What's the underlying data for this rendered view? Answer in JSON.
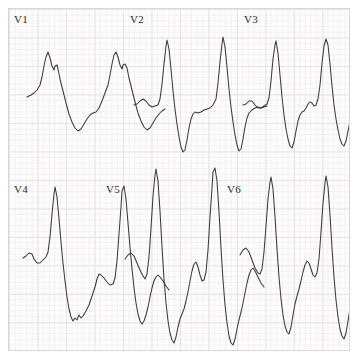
{
  "paper": {
    "background_color": "#fdfdfd",
    "fine_grid_color": "#f4f0f2",
    "major_grid_color": "#e9e3e6",
    "border_color": "#d8d8d8",
    "trace_color": "#3a3a3a",
    "fine_grid_mm_px": 5.7,
    "major_grid_mm_px": 28.5
  },
  "layout": {
    "rows": 2,
    "columns": 3,
    "panel_order": [
      "V1",
      "V2",
      "V3",
      "V4",
      "V5",
      "V6"
    ]
  },
  "leads": [
    {
      "id": "V1",
      "label": "V1",
      "row": 0,
      "column": 0,
      "label_x": 12,
      "label_y": 12,
      "description": "rSR' notched R wave with deep broad S wave, two beats",
      "path": "M 18 88 L 22 86 L 25 84 L 28 81 L 31 76 L 33 68 L 35 57 L 37 48 L 39 43 L 41 49 L 43 57 L 45 61 L 46 57 L 48 56 L 49 60 L 51 70 L 54 82 L 57 94 L 60 105 L 63 113 L 66 119 L 69 122 L 72 120 L 75 115 L 78 110 L 81 106 L 84 104 L 87 103 L 90 99 L 93 92 L 96 84 L 99 76 L 101 66 L 103 55 L 105 46 L 107 43 L 109 48 L 111 56 L 113 60 L 114 56 L 116 55 L 118 59 L 120 69 L 123 81 L 126 93 L 129 104 L 132 112 L 135 118 L 138 121 L 141 119 L 144 114 L 147 109 L 150 105 L 153 102 L 156 100"
    },
    {
      "id": "V2",
      "label": "V2",
      "row": 0,
      "column": 1,
      "label_x": 122,
      "label_y": 12,
      "description": "tall sharp R waves with very deep S waves, two beats",
      "path": "M 10 96 L 13 95 L 16 92 L 19 90 L 22 92 L 25 96 L 28 98 L 31 97 L 34 96 L 36 90 L 38 75 L 40 55 L 42 37 L 43 31 L 45 40 L 47 60 L 49 82 L 51 100 L 53 115 L 55 128 L 57 138 L 59 143 L 61 141 L 63 131 L 65 119 L 67 110 L 69 105 L 71 103 L 74 104 L 77 103 L 80 101 L 83 100 L 86 99 L 89 96 L 92 90 L 94 74 L 96 53 L 98 35 L 99 28 L 101 38 L 103 58 L 105 80 L 107 98 L 109 113 L 111 126 L 113 136 L 115 142 L 117 140 L 119 130 L 121 118 L 123 109 L 125 104 L 128 101 L 131 99 L 134 98 L 137 99 L 140 98 L 143 97"
    },
    {
      "id": "V3",
      "label": "V3",
      "row": 0,
      "column": 2,
      "label_x": 235,
      "label_y": 12,
      "description": "tall R waves with deep S waves and small notch on downstroke, two beats",
      "path": "M 6 96 L 9 95 L 12 92 L 15 92 L 18 96 L 21 99 L 24 99 L 27 97 L 30 95 L 32 89 L 34 72 L 36 50 L 38 36 L 39 32 L 41 44 L 43 66 L 45 88 L 47 106 L 49 120 L 51 130 L 53 137 L 55 139 L 57 133 L 59 122 L 61 112 L 63 106 L 65 103 L 67 102 L 69 99 L 71 95 L 73 93 L 75 94 L 77 97 L 79 96 L 81 90 L 83 76 L 85 54 L 87 37 L 89 30 L 91 36 L 93 55 L 95 77 L 97 96 L 99 110 L 101 121 L 103 130 L 105 135 L 107 137 L 109 132 L 111 122 L 113 113 L 115 108 L 117 106 L 119 105 L 121 102 L 123 97 L 125 94 L 128 93 L 131 95 L 134 98 L 137 99"
    },
    {
      "id": "V4",
      "label": "V4",
      "row": 1,
      "column": 0,
      "label_x": 12,
      "label_y": 185,
      "description": "tall R wave, deep notched S wave with rounded trough, two beats",
      "path": "M 14 249 L 17 247 L 20 244 L 23 245 L 25 250 L 28 254 L 31 254 L 34 251 L 37 248 L 39 243 L 41 228 L 43 205 L 45 185 L 46 178 L 48 188 L 50 210 L 52 233 L 54 254 L 56 272 L 58 288 L 60 300 L 62 308 L 64 312 L 66 309 L 68 311 L 70 306 L 72 309 L 74 307 L 77 302 L 80 296 L 83 287 L 86 278 L 88 270 L 90 265 L 92 266 L 95 269 L 98 273 L 101 276 L 104 275 L 106 269 L 108 252 L 110 225 L 112 198 L 113 182 L 115 177 L 117 190 L 119 214 L 121 238 L 123 260 L 125 279 L 127 294 L 129 305 L 131 312 L 133 315 L 135 312 L 137 306 L 139 298 L 141 288 L 143 279 L 145 272 L 147 268 L 149 266 L 151 268 L 154 272 L 157 277 L 160 281"
    },
    {
      "id": "V5",
      "label": "V5",
      "row": 1,
      "column": 1,
      "label_x": 105,
      "label_y": 185,
      "description": "very tall R waves with very deep S waves and intervening positive deflection",
      "path": "M 8 250 L 11 246 L 14 244 L 17 247 L 20 254 L 23 261 L 26 267 L 28 270 L 30 265 L 32 248 L 34 219 L 36 187 L 38 166 L 39 160 L 41 172 L 43 202 L 45 238 L 47 270 L 49 294 L 51 312 L 53 324 L 55 331 L 57 334 L 59 328 L 61 318 L 63 310 L 65 305 L 67 300 L 69 292 L 71 283 L 73 272 L 75 262 L 77 255 L 79 253 L 81 258 L 83 266 L 85 272 L 87 271 L 89 263 L 91 241 L 93 208 L 95 179 L 96 163 L 98 159 L 100 172 L 102 203 L 104 239 L 106 271 L 108 296 L 110 314 L 112 327 L 114 334 L 116 336 L 118 330 L 120 320 L 122 311 L 124 303 L 126 294 L 128 284 L 130 274 L 132 266 L 134 261 L 136 259 L 138 262 L 141 268 L 144 274 L 147 278"
    },
    {
      "id": "V6",
      "label": "V6",
      "row": 1,
      "column": 2,
      "label_x": 228,
      "label_y": 185,
      "description": "tall R waves with deep S waves, intervening notched positive wave",
      "path": "M 6 246 L 9 241 L 12 239 L 15 243 L 18 251 L 21 259 L 24 264 L 26 265 L 28 260 L 30 243 L 32 217 L 34 190 L 36 173 L 37 168 L 39 180 L 41 208 L 43 240 L 45 268 L 47 290 L 49 306 L 51 317 L 53 323 L 55 325 L 57 318 L 59 306 L 61 295 L 63 287 L 65 280 L 67 272 L 69 263 L 71 256 L 73 252 L 75 254 L 77 260 L 79 266 L 81 268 L 83 264 L 85 250 L 87 223 L 89 194 L 91 174 L 92 167 L 94 178 L 96 206 L 98 239 L 100 268 L 102 291 L 104 308 L 106 320 L 108 327 L 110 330 L 112 324 L 114 312 L 116 300 L 118 291 L 120 283 L 122 274 L 124 266 L 126 261 L 128 259 L 130 262 L 133 268 L 136 274 L 139 279 L 142 282"
    }
  ]
}
